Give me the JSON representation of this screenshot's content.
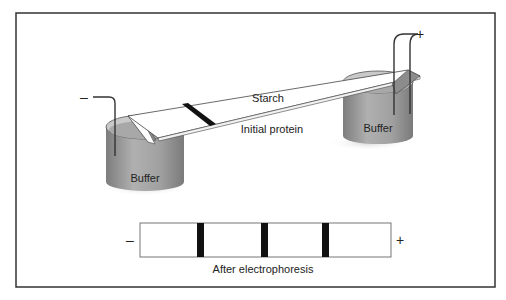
{
  "diagram": {
    "title": "",
    "labels": {
      "strip": "Starch",
      "initial_band": "Initial protein",
      "left_buffer": "Buffer",
      "right_buffer": "Buffer",
      "caption": "After electrophoresis"
    },
    "electrodes": {
      "left_sign": "–",
      "right_sign": "+"
    },
    "result_gel": {
      "left_sign": "–",
      "right_sign": "+",
      "band_count": 3
    },
    "colors": {
      "frame": "#333333",
      "buffer_gray": "#9a9a9a",
      "band": "#111111",
      "background": "#ffffff"
    }
  }
}
